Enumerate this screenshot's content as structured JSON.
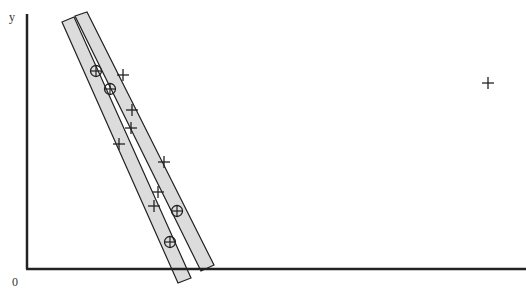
{
  "figure": {
    "y_axis_label": "y",
    "origin_label": "0",
    "colors": {
      "axis": "#222222",
      "band_fill": "#dcdcdc",
      "band_stroke": "#222222",
      "marker": "#222222",
      "background": "#ffffff"
    },
    "axes": {
      "y_axis": {
        "x": 27,
        "y_top": 14,
        "y_bottom": 269
      },
      "x_axis": {
        "y": 269,
        "x_left": 27,
        "x_right": 526
      }
    },
    "bands": [
      {
        "name": "steep-band",
        "points": [
          [
            62,
            22
          ],
          [
            74,
            17
          ],
          [
            191,
            278
          ],
          [
            178,
            283
          ]
        ]
      },
      {
        "name": "shallow-band",
        "points": [
          [
            75,
            16
          ],
          [
            87,
            12
          ],
          [
            214,
            265
          ],
          [
            201,
            271
          ]
        ]
      }
    ],
    "plus_points": [
      [
        123,
        75
      ],
      [
        132,
        110
      ],
      [
        131,
        128
      ],
      [
        119,
        144
      ],
      [
        164,
        162
      ],
      [
        158,
        192
      ],
      [
        154,
        206
      ],
      [
        488,
        83
      ]
    ],
    "circled_points": [
      [
        96,
        71
      ],
      [
        110,
        89
      ],
      [
        177,
        211
      ],
      [
        170,
        242
      ]
    ]
  },
  "chart_data": {
    "type": "scatter",
    "title": "",
    "xlabel": "",
    "ylabel": "y",
    "origin": "0",
    "series": [
      {
        "name": "plus-markers",
        "marker": "+",
        "points_px": [
          [
            123,
            75
          ],
          [
            132,
            110
          ],
          [
            131,
            128
          ],
          [
            119,
            144
          ],
          [
            164,
            162
          ],
          [
            158,
            192
          ],
          [
            154,
            206
          ],
          [
            488,
            83
          ]
        ]
      },
      {
        "name": "circled-plus-markers",
        "marker": "⊕",
        "points_px": [
          [
            96,
            71
          ],
          [
            110,
            89
          ],
          [
            177,
            211
          ],
          [
            170,
            242
          ]
        ]
      }
    ],
    "annotations": [
      {
        "type": "band",
        "description": "two overlapping shaded strips fitting the circled points, one steeper than the other"
      },
      {
        "type": "outlier",
        "description": "single + far to the right at upper area"
      }
    ],
    "grid": false
  }
}
